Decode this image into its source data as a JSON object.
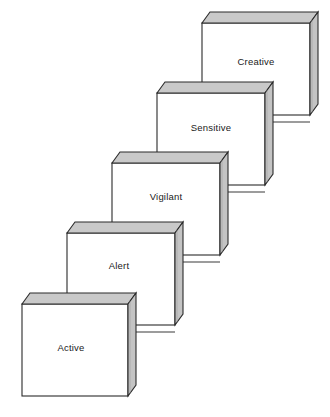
{
  "diagram": {
    "type": "ascending-3d-blocks-staircase",
    "title": "",
    "background_color": "#ffffff",
    "geometry": {
      "face_width": 108,
      "face_height": 92,
      "depth_dx": 8,
      "depth_dy": -11,
      "step_dx": 45,
      "step_dy": -70
    },
    "colors": {
      "front_face": "#ffffff",
      "top_face": "#c9c9c9",
      "side_face": "#c4c4c4",
      "outline": "#2b2b2b",
      "connector_line": "#3a3a3a",
      "label_text": "#1a1a1a"
    },
    "blocks": [
      {
        "id": "block-creative",
        "label": "Creative",
        "level": 5,
        "front": {
          "x": 202,
          "y": 23,
          "w": 108,
          "h": 92
        },
        "label_pos": {
          "x": 256,
          "y": 62
        }
      },
      {
        "id": "block-sensitive",
        "label": "Sensitive",
        "level": 4,
        "front": {
          "x": 157,
          "y": 93,
          "w": 108,
          "h": 92
        },
        "label_pos": {
          "x": 211,
          "y": 128
        }
      },
      {
        "id": "block-vigilant",
        "label": "Vigilant",
        "level": 3,
        "front": {
          "x": 112,
          "y": 163,
          "w": 108,
          "h": 92
        },
        "label_pos": {
          "x": 166,
          "y": 197
        }
      },
      {
        "id": "block-alert",
        "label": "Alert",
        "level": 2,
        "front": {
          "x": 67,
          "y": 233,
          "w": 108,
          "h": 92
        },
        "label_pos": {
          "x": 119,
          "y": 266
        }
      },
      {
        "id": "block-active",
        "label": "Active",
        "level": 1,
        "front": {
          "x": 22,
          "y": 304,
          "w": 106,
          "h": 92
        },
        "label_pos": {
          "x": 71,
          "y": 348
        }
      }
    ],
    "connectors": [
      {
        "id": "connector-active-to-alert",
        "from": "block-active",
        "to": "block-alert",
        "x1": 134,
        "y1": 332,
        "x2": 175,
        "y2": 332
      },
      {
        "id": "connector-alert-to-vigilant",
        "from": "block-alert",
        "to": "block-vigilant",
        "x1": 182,
        "y1": 262,
        "x2": 220,
        "y2": 262
      },
      {
        "id": "connector-vigilant-to-sensitive",
        "from": "block-vigilant",
        "to": "block-sensitive",
        "x1": 227,
        "y1": 192,
        "x2": 265,
        "y2": 192
      },
      {
        "id": "connector-sensitive-to-creative",
        "from": "block-sensitive",
        "to": "block-creative",
        "x1": 272,
        "y1": 122,
        "x2": 310,
        "y2": 122
      }
    ]
  }
}
